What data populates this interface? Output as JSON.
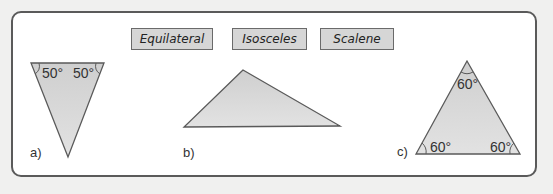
{
  "labels": {
    "equilateral": "Equilateral",
    "isosceles": "Isosceles",
    "scalene": "Scalene"
  },
  "triangles": {
    "a": {
      "label": "a)",
      "angles": [
        "50°",
        "50°"
      ]
    },
    "b": {
      "label": "b)"
    },
    "c": {
      "label": "c)",
      "angles": [
        "60°",
        "60°",
        "60°"
      ]
    }
  },
  "colors": {
    "fill": "#d3d3d3",
    "stroke": "#5a5a5a",
    "tag_bg": "#d6d6d6"
  }
}
